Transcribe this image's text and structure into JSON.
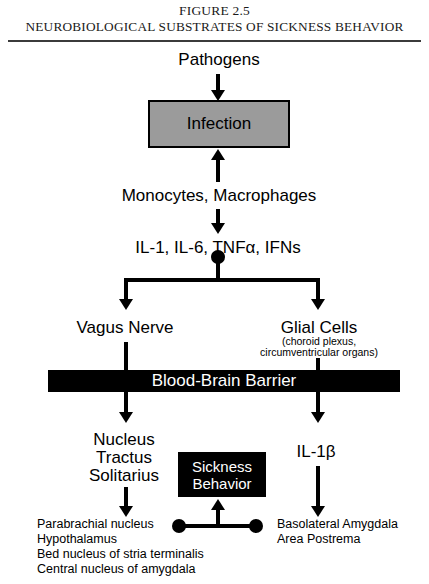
{
  "figure": {
    "number_line": "FIGURE 2.5",
    "title": "NEUROBIOLOGICAL SUBSTRATES OF SICKNESS BEHAVIOR"
  },
  "nodes": {
    "pathogens": "Pathogens",
    "infection": "Infection",
    "monocytes": "Monocytes, Macrophages",
    "cytokines": "IL-1, IL-6, TNFα, IFNs",
    "vagus_nerve": "Vagus Nerve",
    "glial_cells": "Glial Cells",
    "glial_cells_sub_line1": "(choroid plexus,",
    "glial_cells_sub_line2": "circumventricular organs)",
    "blood_brain_barrier": "Blood-Brain Barrier",
    "nts_line1": "Nucleus",
    "nts_line2": "Tractus",
    "nts_line3": "Solitarius",
    "sickness_line1": "Sickness",
    "sickness_line2": "Behavior",
    "il1beta": "IL-1β",
    "left_targets_line1": "Parabrachial nucleus",
    "left_targets_line2": "Hypothalamus",
    "left_targets_line3": "Bed nucleus of stria terminalis",
    "left_targets_line4": "Central nucleus of amygdala",
    "right_targets_line1": "Basolateral Amygdala",
    "right_targets_line2": "Area Postrema"
  },
  "colors": {
    "infection_box_fill": "#9b9b9b",
    "bar_fill": "#000000",
    "bar_text": "#ffffff",
    "line": "#000000",
    "page_background": "#ffffff"
  }
}
